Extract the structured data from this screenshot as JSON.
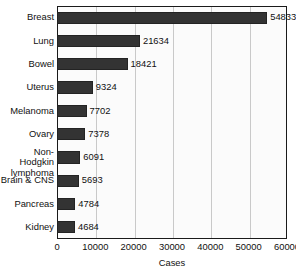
{
  "chart_data": {
    "type": "bar",
    "orientation": "horizontal",
    "title": "",
    "xlabel": "Cases",
    "ylabel": "",
    "xlim": [
      0,
      60000
    ],
    "xticks": [
      0,
      10000,
      20000,
      30000,
      40000,
      50000,
      60000
    ],
    "xtick_labels": [
      "0",
      "10000",
      "20000",
      "30000",
      "40000",
      "50000",
      "60000"
    ],
    "grid": "vertical",
    "legend": "none",
    "categories": [
      "Breast",
      "Lung",
      "Bowel",
      "Uterus",
      "Melanoma",
      "Non-Hodgkin\nlymphoma",
      "Ovary",
      "Brain & CNS",
      "Pancreas",
      "Kidney"
    ],
    "values": [
      54833,
      21634,
      18421,
      9324,
      7702,
      6091,
      7378,
      5693,
      4784,
      4684
    ],
    "bars": [
      {
        "category": "Breast",
        "value": 54833,
        "value_label": "54833"
      },
      {
        "category": "Lung",
        "value": 21634,
        "value_label": "21634"
      },
      {
        "category": "Bowel",
        "value": 18421,
        "value_label": "18421"
      },
      {
        "category": "Uterus",
        "value": 9324,
        "value_label": "9324"
      },
      {
        "category": "Melanoma",
        "value": 7702,
        "value_label": "7702"
      },
      {
        "category": "Ovary",
        "value": 7378,
        "value_label": "7378"
      },
      {
        "category": "Non-Hodgkin\nlymphoma",
        "value": 6091,
        "value_label": "6091"
      },
      {
        "category": "Brain & CNS",
        "value": 5693,
        "value_label": "5693"
      },
      {
        "category": "Pancreas",
        "value": 4784,
        "value_label": "4784"
      },
      {
        "category": "Kidney",
        "value": 4684,
        "value_label": "4684"
      }
    ],
    "colors": {
      "bar_fill": "#333333",
      "bar_edge": "#232323",
      "plot_background": "#fbfbfb",
      "gridline": "#c9c9c9",
      "axis_border": "#1a1a1a",
      "text": "#111111"
    }
  }
}
